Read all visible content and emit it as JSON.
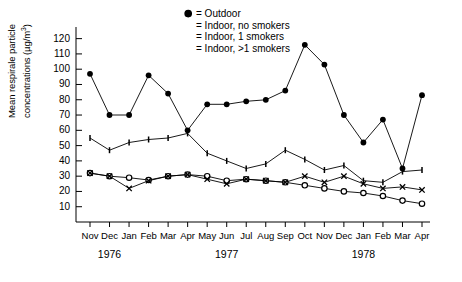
{
  "chart_data": {
    "type": "line",
    "title": "",
    "xlabel": "",
    "ylabel": "Mean respirale particle concentrations (µg/m³)",
    "ylabel_main": "Mean respirale particle",
    "ylabel_sub": "concentrations (µg/m",
    "ylabel_exp": "3",
    "ylabel_close": ")",
    "ylim": [
      0,
      125
    ],
    "yticks": [
      120,
      110,
      100,
      90,
      80,
      70,
      60,
      50,
      40,
      30,
      20,
      10
    ],
    "grid": false,
    "legend_position": "top-center",
    "categories": [
      "Nov",
      "Dec",
      "Jan",
      "Feb",
      "Mar",
      "Apr",
      "May",
      "Jun",
      "Jul",
      "Aug",
      "Sep",
      "Oct",
      "Nov",
      "Dec",
      "Jan",
      "Feb",
      "Mar",
      "Apr"
    ],
    "year_labels": [
      {
        "text": "1976",
        "index": 1
      },
      {
        "text": "1977",
        "index": 7
      },
      {
        "text": "1978",
        "index": 14
      }
    ],
    "series": [
      {
        "name": "Outdoor",
        "legend": "= Outdoor",
        "marker": "open-circle",
        "values": [
          32,
          30,
          29,
          27.5,
          30,
          31,
          30,
          27,
          28,
          27,
          26,
          24,
          22,
          20,
          19,
          17,
          14,
          12
        ]
      },
      {
        "name": "Indoor, no smokers",
        "legend": "= Indoor, no smokers",
        "marker": "cross",
        "values": [
          32,
          30,
          22,
          27,
          30,
          31,
          28,
          25,
          28,
          27,
          26,
          30,
          26,
          30,
          25,
          22,
          23,
          21
        ]
      },
      {
        "name": "Indoor, 1 smokers",
        "legend": "= Indoor, 1 smokers",
        "marker": "tick",
        "values": [
          55,
          47,
          52,
          54,
          55,
          58,
          45,
          40,
          35,
          38,
          47,
          41,
          34,
          37,
          27,
          26,
          33,
          34
        ]
      },
      {
        "name": "Indoor, >1 smokers",
        "legend": "= Indoor, >1 smokers",
        "marker": "filled-circle",
        "values": [
          97,
          70,
          70,
          96,
          84,
          60,
          77,
          77,
          79,
          80,
          86,
          116,
          103,
          70,
          52,
          67,
          35,
          83
        ]
      }
    ]
  }
}
